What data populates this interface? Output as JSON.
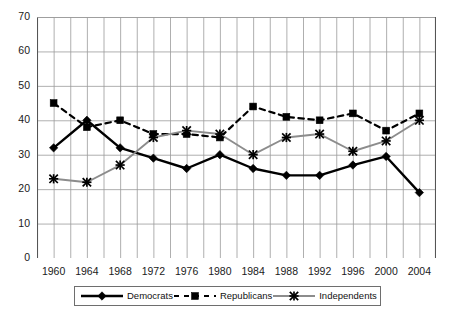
{
  "chart_data": {
    "type": "line",
    "title": "",
    "subtitle": "",
    "xlabel": "",
    "ylabel": "",
    "x": [
      1960,
      1964,
      1968,
      1972,
      1976,
      1980,
      1984,
      1988,
      1992,
      1996,
      2000,
      2004
    ],
    "categories": [
      "1960",
      "1964",
      "1968",
      "1972",
      "1976",
      "1980",
      "1984",
      "1988",
      "1992",
      "1996",
      "2000",
      "2004"
    ],
    "xlim": [
      1958,
      2006
    ],
    "ylim": [
      0,
      70
    ],
    "yticks": [
      0,
      10,
      20,
      30,
      40,
      50,
      60,
      70
    ],
    "ytick_labels": [
      "0",
      "10",
      "20",
      "30",
      "40",
      "50",
      "60",
      "70"
    ],
    "xticks": [
      1960,
      1964,
      1968,
      1972,
      1976,
      1980,
      1984,
      1988,
      1992,
      1996,
      2000,
      2004
    ],
    "xtick_labels": [
      "1960",
      "1964",
      "1968",
      "1972",
      "1976",
      "1980",
      "1984",
      "1988",
      "1992",
      "1996",
      "2000",
      "2004"
    ],
    "x_minor_interval": 2,
    "grid": true,
    "grid_color": "#9a9a9a",
    "legend_position": "bottom",
    "series": [
      {
        "name": "Democrats",
        "color": "#000000",
        "line_style": "solid",
        "marker": "diamond",
        "values": [
          32,
          40,
          32,
          29,
          26,
          30,
          26,
          24,
          24,
          27,
          29.5,
          19
        ]
      },
      {
        "name": "Republicans",
        "color": "#000000",
        "line_style": "dashed",
        "marker": "square",
        "values": [
          45,
          38,
          40,
          36,
          36,
          35,
          44,
          41,
          40,
          42,
          37,
          42
        ]
      },
      {
        "name": "Independents",
        "color": "#8c8c8c",
        "line_style": "solid",
        "marker": "x-star",
        "values": [
          23,
          22,
          27,
          35,
          37,
          36,
          30,
          35,
          36,
          31,
          34,
          40
        ]
      }
    ]
  },
  "legend": {
    "entries": [
      {
        "label": "Democrats"
      },
      {
        "label": "Republicans"
      },
      {
        "label": "Independents"
      }
    ]
  },
  "axes": {
    "y_axis_name": "percent-axis",
    "x_axis_name": "year-axis"
  }
}
